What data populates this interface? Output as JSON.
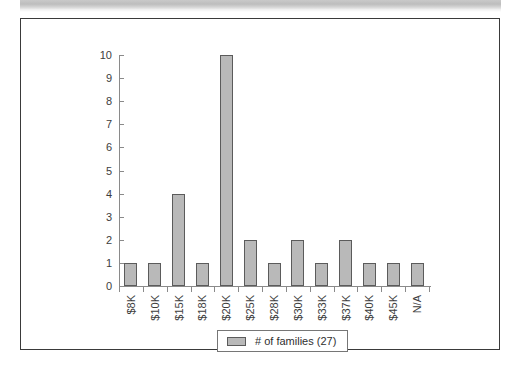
{
  "page": {
    "background_color": "#ffffff",
    "frame_border_color": "#3a3a3a",
    "scan_band_color": "#c9c9c9"
  },
  "chart_data": {
    "type": "bar",
    "title": "",
    "subtitle": "",
    "xlabel": "",
    "ylabel": "",
    "categories": [
      "$8K",
      "$10K",
      "$15K",
      "$18K",
      "$20K",
      "$25K",
      "$28K",
      "$30K",
      "$33K",
      "$37K",
      "$40K",
      "$45K",
      "N/A"
    ],
    "values": [
      1,
      1,
      4,
      1,
      10,
      2,
      1,
      2,
      1,
      2,
      1,
      1,
      1
    ],
    "series": [
      {
        "name": "# of families (27)",
        "values": [
          1,
          1,
          4,
          1,
          10,
          2,
          1,
          2,
          1,
          2,
          1,
          1,
          1
        ],
        "color": "#b9b9b9",
        "border_color": "#5b5b5b"
      }
    ],
    "ylim": [
      0,
      10
    ],
    "ytick_labels": [
      "0",
      "1",
      "2",
      "3",
      "4",
      "5",
      "6",
      "7",
      "8",
      "9",
      "10"
    ],
    "ytick_values": [
      0,
      1,
      2,
      3,
      4,
      5,
      6,
      7,
      8,
      9,
      10
    ],
    "grid": false,
    "legend": {
      "position": "bottom-center",
      "entries": [
        {
          "label": "# of families (27)",
          "swatch_color": "#b9b9b9"
        }
      ]
    },
    "axis_line_color": "#8a8a8a"
  }
}
